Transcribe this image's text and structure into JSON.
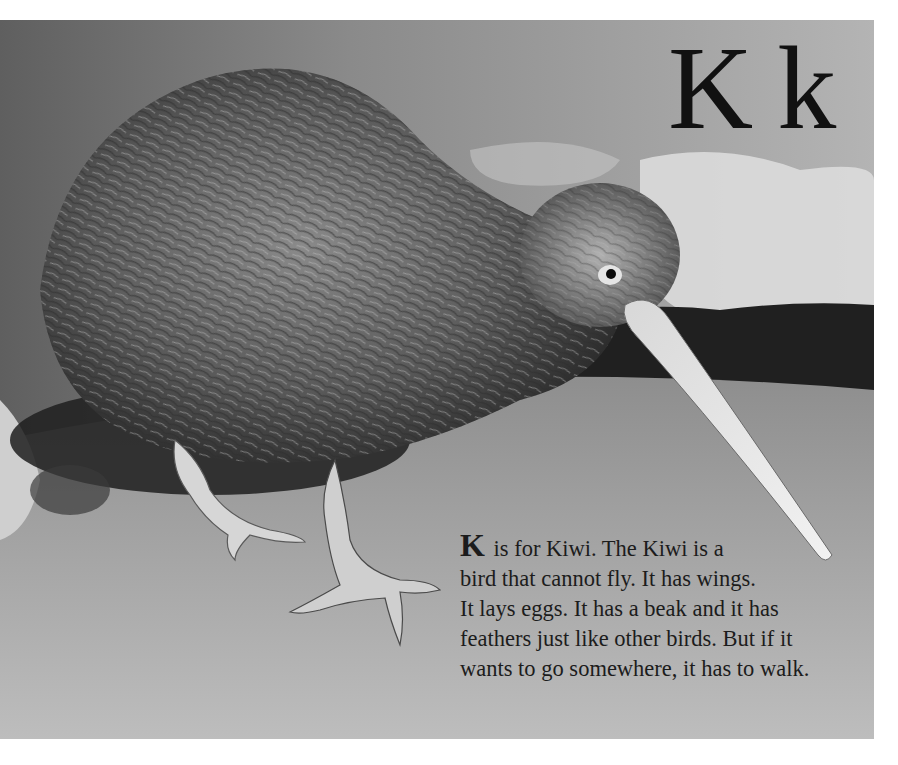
{
  "page": {
    "heading": {
      "uppercase": "K",
      "lowercase": "k"
    },
    "caption": {
      "dropcap": "K",
      "lines": [
        " is for Kiwi. The Kiwi is a",
        "bird that cannot fly. It has wings.",
        "It lays eggs. It has a beak and it has",
        "feathers just like other birds. But if it",
        "wants to go somewhere, it has to walk."
      ]
    },
    "illustration": {
      "subject": "kiwi-bird",
      "style": "grayscale watercolor"
    }
  }
}
